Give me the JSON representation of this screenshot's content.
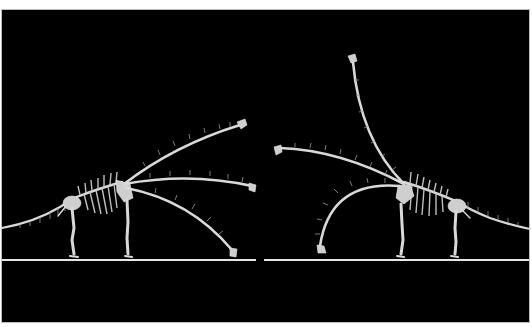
{
  "figure": {
    "background_color": "#000000",
    "bone_color": "#d9d9d9",
    "ground_color": "#e6e6e6"
  },
  "skeletons": [
    {
      "id": "left",
      "facing": "right",
      "neck_poses": [
        "high-forward",
        "horizontal",
        "lowered"
      ]
    },
    {
      "id": "right",
      "facing": "left",
      "neck_poses": [
        "vertical",
        "horizontal",
        "lowered-curved"
      ]
    }
  ]
}
